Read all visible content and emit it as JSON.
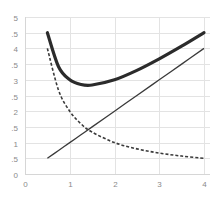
{
  "chart_data": {
    "type": "line",
    "title": "",
    "xlabel": "",
    "ylabel": "",
    "xlim": [
      0,
      4
    ],
    "ylim": [
      0,
      5
    ],
    "grid": true,
    "legend": null,
    "x_ticks": [
      "0",
      "1",
      "2",
      "3",
      "4"
    ],
    "y_ticks_visible": [
      "0",
      ".5",
      "1",
      ".5",
      "2",
      ".5",
      "3",
      ".5",
      "4",
      ".5",
      "5"
    ],
    "y_tick_values": [
      0,
      0.5,
      1,
      1.5,
      2,
      2.5,
      3,
      3.5,
      4,
      4.5,
      5
    ],
    "x": [
      0.5,
      0.75,
      1,
      1.25,
      1.5,
      2,
      2.5,
      3,
      3.5,
      4
    ],
    "series": [
      {
        "name": "total (thick solid)",
        "style": "thick-solid",
        "color": "#2b2b2b",
        "values": [
          4.5,
          3.417,
          3.0,
          2.85,
          2.833,
          3.0,
          3.3,
          3.667,
          4.071,
          4.5
        ]
      },
      {
        "name": "linear (thin solid)",
        "style": "thin-solid",
        "color": "#3a3a3a",
        "values": [
          0.5,
          0.75,
          1.0,
          1.25,
          1.5,
          2.0,
          2.5,
          3.0,
          3.5,
          4.0
        ]
      },
      {
        "name": "inverse (dashed)",
        "style": "dashed",
        "color": "#3a3a3a",
        "values": [
          4.0,
          2.667,
          2.0,
          1.6,
          1.333,
          1.0,
          0.8,
          0.667,
          0.571,
          0.5
        ]
      }
    ]
  }
}
